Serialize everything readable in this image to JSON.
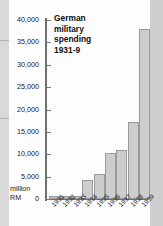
{
  "chart_data": {
    "type": "bar",
    "title": "German military spending 1931-9",
    "title_lines": [
      "German",
      "military",
      "spending",
      "1931-9"
    ],
    "xlabel": "",
    "ylabel": "million RM",
    "ylabel_lines": [
      "million",
      "RM"
    ],
    "categories": [
      "1931",
      "1932",
      "1933",
      "1934",
      "1935",
      "1936",
      "1937",
      "1938",
      "1939"
    ],
    "values": [
      610,
      720,
      720,
      4300,
      5600,
      10300,
      10900,
      17200,
      38000
    ],
    "ylim": [
      0,
      40000
    ],
    "ytick_labels": [
      "40,000",
      "35,000",
      "30,000",
      "25,000",
      "20,000",
      "15,000",
      "10,000",
      "5,000",
      "0"
    ],
    "ytick_values": [
      40000,
      35000,
      30000,
      25000,
      20000,
      15000,
      10000,
      5000,
      0
    ],
    "grid": false,
    "legend": "none",
    "bar_color": "#cdcdcd",
    "bar_border_color": "#9a9a9a",
    "axis_color": "#6f6f6f",
    "text_color": "#1a1a1a"
  }
}
